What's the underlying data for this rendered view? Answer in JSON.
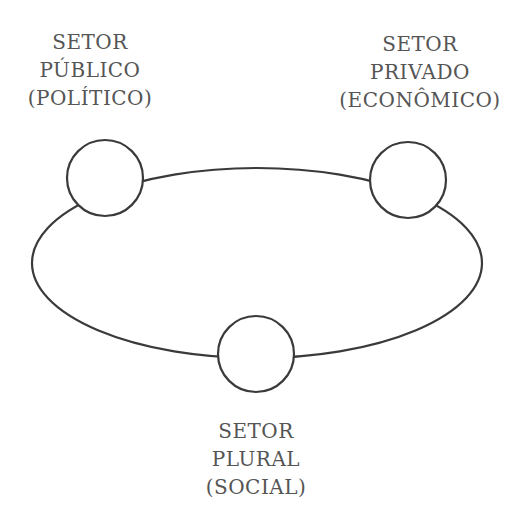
{
  "diagram": {
    "type": "ring-of-nodes",
    "stroke_color": "#3a3a3a",
    "text_color": "#555555",
    "nodes": [
      {
        "id": "publico",
        "lines": [
          "SETOR",
          "PÚBLICO",
          "(POLÍTICO)"
        ]
      },
      {
        "id": "privado",
        "lines": [
          "SETOR",
          "PRIVADO",
          "(ECONÔMICO)"
        ]
      },
      {
        "id": "plural",
        "lines": [
          "SETOR",
          "PLURAL",
          "(SOCIAL)"
        ]
      }
    ]
  }
}
